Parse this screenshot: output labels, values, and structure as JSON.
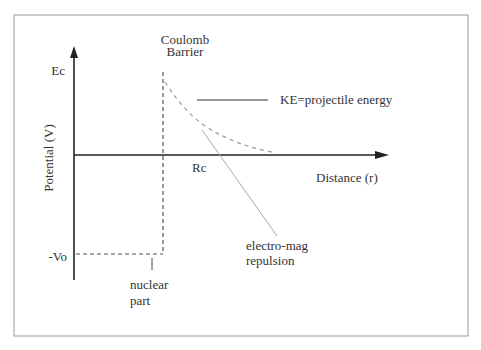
{
  "diagram": {
    "title": "Coulomb Barrier",
    "title_line1": "Coulomb",
    "title_line2": "Barrier",
    "y_axis_label": "Potential (V)",
    "x_axis_label": "Distance (r)",
    "y_tick_top": "Ec",
    "y_tick_bottom": "-Vo",
    "x_tick": "Rc",
    "ke_label": "KE=projectile energy",
    "nuclear_label_line1": "nuclear",
    "nuclear_label_line2": "part",
    "em_label_line1": "electro-mag",
    "em_label_line2": "repulsion",
    "colors": {
      "axis": "#222222",
      "dashed": "#555555",
      "curve": "#999999",
      "pointer": "#aaaaaa",
      "frame": "#999999"
    }
  }
}
